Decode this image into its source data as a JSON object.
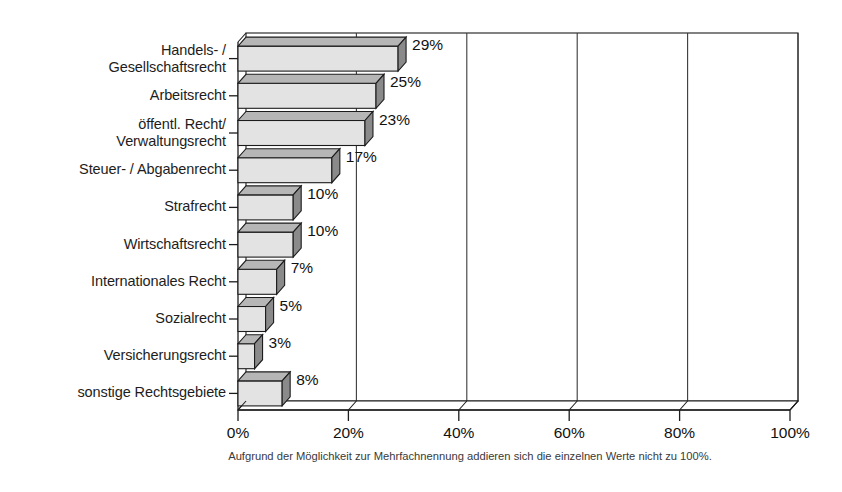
{
  "chart_data": {
    "type": "bar",
    "orientation": "horizontal",
    "style": "3d",
    "title": "",
    "subtitle": "",
    "xlabel": "",
    "ylabel": "",
    "xlim": [
      0,
      100
    ],
    "grid": true,
    "grid_axis": "x",
    "legend": false,
    "tick_suffix": "%",
    "categories": [
      "Handels- /\nGesellschaftsrecht",
      "Arbeitsrecht",
      "öffentl. Recht/\nVerwaltungsrecht",
      "Steuer- / Abgabenrecht",
      "Strafrecht",
      "Wirtschaftsrecht",
      "Internationales Recht",
      "Sozialrecht",
      "Versicherungsrecht",
      "sonstige Rechtsgebiete"
    ],
    "values": [
      29,
      25,
      23,
      17,
      10,
      10,
      7,
      5,
      3,
      8
    ],
    "value_labels": [
      "29%",
      "25%",
      "23%",
      "17%",
      "10%",
      "10%",
      "7%",
      "5%",
      "3%",
      "8%"
    ],
    "xticks": [
      0,
      20,
      40,
      60,
      80,
      100
    ],
    "xtick_labels": [
      "0%",
      "20%",
      "40%",
      "60%",
      "80%",
      "100%"
    ],
    "annotation": "Aufgrund der Möglichkeit zur Mehrfachnennung addieren sich die einzelnen Werte nicht zu 100%.",
    "colors": {
      "bar_front": "#e3e3e3",
      "bar_top": "#b6b6b6",
      "bar_side": "#8a8a8a",
      "outline": "#1c1c1c",
      "gridline": "#3a3a3a",
      "axis": "#1c1c1c",
      "background": "#ffffff",
      "text": "#1a1a1a"
    }
  }
}
